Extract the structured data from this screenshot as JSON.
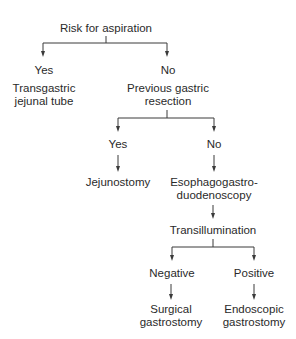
{
  "diagram": {
    "type": "decision-flowchart",
    "colors": {
      "text": "#2a2a2a",
      "lines": "#3a3a3a",
      "background": "#ffffff"
    },
    "nodes": {
      "root": {
        "label": "Risk for aspiration"
      },
      "aspiration_yes": {
        "label": "Yes"
      },
      "aspiration_yes_outcome": {
        "line1": "Transgastric",
        "line2": "jejunal tube"
      },
      "aspiration_no": {
        "label": "No"
      },
      "gastric_resection": {
        "line1": "Previous gastric",
        "line2": "resection"
      },
      "resection_yes": {
        "label": "Yes"
      },
      "jejunostomy": {
        "label": "Jejunostomy"
      },
      "resection_no": {
        "label": "No"
      },
      "egd": {
        "line1": "Esophagogastro-",
        "line2": "duodenoscopy"
      },
      "transillumination": {
        "label": "Transillumination"
      },
      "negative": {
        "label": "Negative"
      },
      "surgical": {
        "line1": "Surgical",
        "line2": "gastrostomy"
      },
      "positive": {
        "label": "Positive"
      },
      "endoscopic": {
        "line1": "Endoscopic",
        "line2": "gastrostomy"
      }
    },
    "edges": [
      {
        "from": "root",
        "to": "aspiration_yes"
      },
      {
        "from": "root",
        "to": "aspiration_no"
      },
      {
        "from": "gastric_resection",
        "to": "resection_yes"
      },
      {
        "from": "gastric_resection",
        "to": "resection_no"
      },
      {
        "from": "resection_yes",
        "to": "jejunostomy"
      },
      {
        "from": "resection_no",
        "to": "egd"
      },
      {
        "from": "egd",
        "to": "transillumination"
      },
      {
        "from": "transillumination",
        "to": "negative"
      },
      {
        "from": "transillumination",
        "to": "positive"
      },
      {
        "from": "negative",
        "to": "surgical"
      },
      {
        "from": "positive",
        "to": "endoscopic"
      }
    ]
  }
}
